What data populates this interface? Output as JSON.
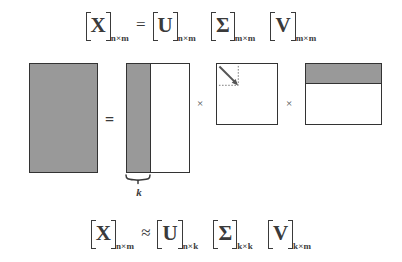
{
  "figure": {
    "type": "svd-decomposition-diagram",
    "colors": {
      "matrix_fill_gray": "#999999",
      "matrix_border": "#333333",
      "matrix_fill_white": "#ffffff",
      "text": "#3a3a3a",
      "background": "#ffffff",
      "dotted_guide": "#777777"
    }
  },
  "equation_top": {
    "lhs": {
      "symbol": "X",
      "subscript": "n×m"
    },
    "relation": "=",
    "factors": [
      {
        "symbol": "U",
        "subscript": "n×m"
      },
      {
        "symbol": "Σ",
        "subscript": "m×m"
      },
      {
        "symbol": "V",
        "subscript": "m×m"
      }
    ]
  },
  "equation_bottom": {
    "lhs": {
      "symbol": "X",
      "subscript": "n×m"
    },
    "relation": "≈",
    "factors": [
      {
        "symbol": "U",
        "subscript": "n×k"
      },
      {
        "symbol": "Σ",
        "subscript": "k×k"
      },
      {
        "symbol": "V",
        "subscript": "k×m"
      }
    ]
  },
  "diagram": {
    "equals_sign": "=",
    "multiply_sign_1": "×",
    "multiply_sign_2": "×",
    "brace_label_k": "k",
    "blocks": [
      {
        "name": "X",
        "shape": "tall-rectangle",
        "fill": "all-gray"
      },
      {
        "name": "U",
        "shape": "tall-rectangle",
        "fill": "left-strip-gray-rest-white"
      },
      {
        "name": "Sigma",
        "shape": "square",
        "fill": "white",
        "annotation": "diagonal-arrow-with-dotted-k-by-k-subblock"
      },
      {
        "name": "V",
        "shape": "square",
        "fill": "top-band-gray-rest-white"
      }
    ]
  }
}
